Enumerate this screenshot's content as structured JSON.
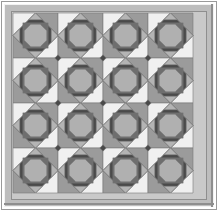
{
  "artwork": {
    "title": "Storm at Sea Quilt Block Pattern",
    "description": "Square quilt photograph with a framed border and a 4 by 4 grid of octagon star blocks",
    "canvas": {
      "width": 218,
      "height": 211
    }
  },
  "palette": {
    "page_background": "#ffffff",
    "outer_frame_light": "#f2f2f2",
    "outer_frame_line": "#9a9a9a",
    "border_band": "#bdbdbd",
    "border_band_shadow": "#8e8e8e",
    "border_band_highlight": "#d6d6d6",
    "field_background": "#c9c9c9",
    "block_dark": "#4a4a4a",
    "block_mid_dark": "#6e6e6e",
    "block_mid": "#9b9b9b",
    "block_light": "#b4b4b4",
    "block_center": "#b0b0b0",
    "block_white": "#f0f0f0",
    "seam_line": "#7a7a7a"
  },
  "frame": {
    "outer_margin": 3,
    "border_band_width": 9,
    "field_inset": 12
  },
  "grid": {
    "rows": 4,
    "columns": 4,
    "block_size": 45,
    "origin_x": 13,
    "origin_y": 13,
    "block_count": 16,
    "row_labels": [
      "row-1",
      "row-2",
      "row-3",
      "row-4"
    ],
    "column_labels": [
      "col-1",
      "col-2",
      "col-3",
      "col-4"
    ]
  },
  "block": {
    "name": "octagon-star-block",
    "center_shape": "octagon",
    "ring_shape": "octagon-ring",
    "corner_shape": "triangle",
    "edge_shape": "triangle"
  },
  "blocks": [
    {
      "id": "block-r1c1",
      "row": 1,
      "col": 1,
      "cx": 35.5,
      "cy": 35.5
    },
    {
      "id": "block-r1c2",
      "row": 1,
      "col": 2,
      "cx": 80.5,
      "cy": 35.5
    },
    {
      "id": "block-r1c3",
      "row": 1,
      "col": 3,
      "cx": 125.5,
      "cy": 35.5
    },
    {
      "id": "block-r1c4",
      "row": 1,
      "col": 4,
      "cx": 170.5,
      "cy": 35.5
    },
    {
      "id": "block-r2c1",
      "row": 2,
      "col": 1,
      "cx": 35.5,
      "cy": 80.5
    },
    {
      "id": "block-r2c2",
      "row": 2,
      "col": 2,
      "cx": 80.5,
      "cy": 80.5
    },
    {
      "id": "block-r2c3",
      "row": 2,
      "col": 3,
      "cx": 125.5,
      "cy": 80.5
    },
    {
      "id": "block-r2c4",
      "row": 2,
      "col": 4,
      "cx": 170.5,
      "cy": 80.5
    },
    {
      "id": "block-r3c1",
      "row": 3,
      "col": 1,
      "cx": 35.5,
      "cy": 125.5
    },
    {
      "id": "block-r3c2",
      "row": 3,
      "col": 2,
      "cx": 80.5,
      "cy": 125.5
    },
    {
      "id": "block-r3c3",
      "row": 3,
      "col": 3,
      "cx": 125.5,
      "cy": 125.5
    },
    {
      "id": "block-r3c4",
      "row": 3,
      "col": 4,
      "cx": 170.5,
      "cy": 125.5
    },
    {
      "id": "block-r4c1",
      "row": 4,
      "col": 1,
      "cx": 35.5,
      "cy": 170.5
    },
    {
      "id": "block-r4c2",
      "row": 4,
      "col": 2,
      "cx": 80.5,
      "cy": 170.5
    },
    {
      "id": "block-r4c3",
      "row": 4,
      "col": 3,
      "cx": 125.5,
      "cy": 170.5
    },
    {
      "id": "block-r4c4",
      "row": 4,
      "col": 4,
      "cx": 170.5,
      "cy": 170.5
    }
  ],
  "connectors": [
    {
      "id": "connector-c1",
      "cx": 58,
      "cy": 58
    },
    {
      "id": "connector-c2",
      "cx": 103,
      "cy": 58
    },
    {
      "id": "connector-c3",
      "cx": 148,
      "cy": 58
    },
    {
      "id": "connector-c4",
      "cx": 58,
      "cy": 103
    },
    {
      "id": "connector-c5",
      "cx": 103,
      "cy": 103
    },
    {
      "id": "connector-c6",
      "cx": 148,
      "cy": 103
    },
    {
      "id": "connector-c7",
      "cx": 58,
      "cy": 148
    },
    {
      "id": "connector-c8",
      "cx": 103,
      "cy": 148
    },
    {
      "id": "connector-c9",
      "cx": 148,
      "cy": 148
    }
  ]
}
